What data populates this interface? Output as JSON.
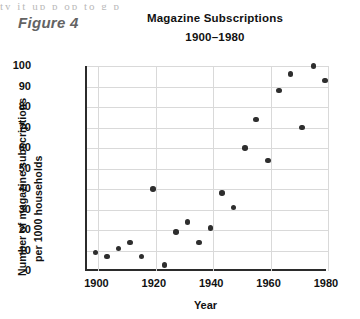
{
  "page": {
    "bleed_text": "ty  it  up  p  op      to  g  p",
    "figure_label": "Figure 4"
  },
  "chart_data": {
    "type": "scatter",
    "title": "Magazine Subscriptions",
    "subtitle": "1900–1980",
    "xlabel": "Year",
    "ylabel_line1": "Number of magazine subscriptions",
    "ylabel_line2": "per 1000 households",
    "xlim": [
      1896,
      1980
    ],
    "ylim": [
      0,
      100
    ],
    "grid": true,
    "legend": "none",
    "xticks": [
      1900,
      1920,
      1940,
      1960,
      1980
    ],
    "xtick_labels": [
      "1900",
      "1920",
      "1940",
      "1960",
      "1980"
    ],
    "yticks": [
      0,
      10,
      20,
      30,
      40,
      50,
      60,
      70,
      80,
      90,
      100
    ],
    "ytick_labels": [
      "0",
      "10",
      "20",
      "30",
      "40",
      "50",
      "60",
      "70",
      "80",
      "90",
      "100"
    ],
    "marker": "filled-circle",
    "marker_color": "#2e2e2e",
    "points": [
      {
        "x": 1899,
        "y": 9
      },
      {
        "x": 1903,
        "y": 7
      },
      {
        "x": 1907,
        "y": 11
      },
      {
        "x": 1911,
        "y": 14
      },
      {
        "x": 1915,
        "y": 7
      },
      {
        "x": 1919,
        "y": 40
      },
      {
        "x": 1923,
        "y": 3
      },
      {
        "x": 1927,
        "y": 19
      },
      {
        "x": 1931,
        "y": 24
      },
      {
        "x": 1935,
        "y": 14
      },
      {
        "x": 1939,
        "y": 21
      },
      {
        "x": 1943,
        "y": 38
      },
      {
        "x": 1947,
        "y": 31
      },
      {
        "x": 1951,
        "y": 60
      },
      {
        "x": 1955,
        "y": 74
      },
      {
        "x": 1959,
        "y": 54
      },
      {
        "x": 1963,
        "y": 88
      },
      {
        "x": 1967,
        "y": 96
      },
      {
        "x": 1971,
        "y": 70
      },
      {
        "x": 1975,
        "y": 100
      },
      {
        "x": 1979,
        "y": 93
      }
    ]
  }
}
